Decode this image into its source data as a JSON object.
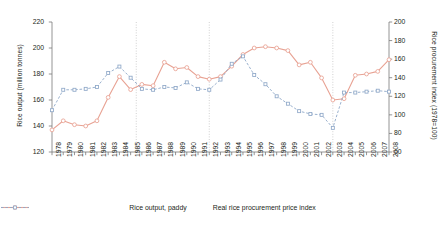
{
  "chart_data": {
    "type": "line",
    "title": "",
    "xlabel": "",
    "ylabel": "Rice output (million tonnes)",
    "ylabel_right": "Rice procurement index (1978=100)",
    "ylim": [
      120,
      220
    ],
    "ylim_right": [
      60,
      200
    ],
    "yticks": [
      120,
      140,
      160,
      180,
      200,
      220
    ],
    "yticks_right": [
      60,
      80,
      100,
      120,
      140,
      160,
      180,
      200
    ],
    "grid": false,
    "legend_position": "bottom-center",
    "categories": [
      "1978",
      "1979",
      "1980",
      "1981",
      "1982",
      "1983",
      "1984",
      "1985",
      "1986",
      "1987",
      "1988",
      "1989",
      "1990",
      "1991",
      "1992",
      "1993",
      "1994",
      "1995",
      "1996",
      "1997",
      "1998",
      "1999",
      "2000",
      "2001",
      "2002",
      "2003",
      "2004",
      "2005",
      "2006",
      "2007",
      "2008"
    ],
    "reference_lines": [
      "1985.5",
      "1992",
      "2003"
    ],
    "series": [
      {
        "name": "Rice output, paddy",
        "axis": "left",
        "color": "#e8a293",
        "marker": "circle",
        "style": "solid",
        "values": [
          137,
          144,
          141,
          140,
          144,
          162,
          178,
          168,
          172,
          171,
          189,
          184,
          185,
          178,
          176,
          178,
          186,
          195,
          200,
          201,
          200,
          198,
          187,
          189,
          177,
          160,
          161,
          179,
          180,
          182,
          191
        ]
      },
      {
        "name": "Real rice procurement price index",
        "axis": "right",
        "color": "#8fa8c8",
        "marker": "square",
        "style": "dashed",
        "values": [
          105,
          127,
          127,
          128,
          130,
          145,
          152,
          140,
          128,
          127,
          130,
          129,
          135,
          128,
          127,
          138,
          155,
          163,
          143,
          133,
          120,
          112,
          104,
          101,
          100,
          86,
          124,
          124,
          125,
          126,
          125
        ]
      }
    ]
  },
  "legend": {
    "items": [
      {
        "label": "Rice output, paddy"
      },
      {
        "label": "Real rice procurement price index"
      }
    ]
  }
}
